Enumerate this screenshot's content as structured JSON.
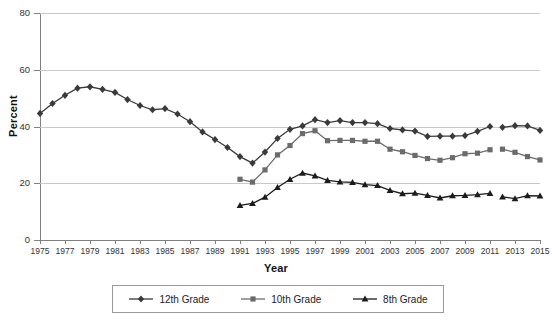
{
  "chart_data": {
    "type": "line",
    "title": "",
    "xlabel": "Year",
    "ylabel": "Percent",
    "xlim": [
      1975,
      2015
    ],
    "ylim": [
      0,
      80
    ],
    "yticks": [
      0,
      20,
      40,
      60,
      80
    ],
    "xticks": [
      1975,
      1977,
      1979,
      1981,
      1983,
      1985,
      1987,
      1989,
      1991,
      1993,
      1995,
      1997,
      1999,
      2001,
      2003,
      2005,
      2007,
      2009,
      2011,
      2013,
      2015
    ],
    "grid": "horizontal",
    "legend_position": "bottom",
    "x": [
      1975,
      1976,
      1977,
      1978,
      1979,
      1980,
      1981,
      1982,
      1983,
      1984,
      1985,
      1986,
      1987,
      1988,
      1989,
      1990,
      1991,
      1992,
      1993,
      1994,
      1995,
      1996,
      1997,
      1998,
      1999,
      2000,
      2001,
      2002,
      2003,
      2004,
      2005,
      2006,
      2007,
      2008,
      2009,
      2010,
      2011,
      2012,
      2013,
      2014,
      2015
    ],
    "series": [
      {
        "name": "12th Grade",
        "marker": "diamond",
        "color": "#3a3a3a",
        "values": [
          44.6,
          48.1,
          51.0,
          53.5,
          54.0,
          53.1,
          52.0,
          49.5,
          47.4,
          45.9,
          46.3,
          44.4,
          41.7,
          38.1,
          35.4,
          32.6,
          29.4,
          27.1,
          31.0,
          35.8,
          39.0,
          40.2,
          42.4,
          41.4,
          42.1,
          41.4,
          41.4,
          41.0,
          39.3,
          38.8,
          38.4,
          36.5,
          36.6,
          36.6,
          36.8,
          38.3,
          40.0,
          39.7,
          40.3,
          40.2,
          38.6
        ]
      },
      {
        "name": "10th Grade",
        "marker": "square",
        "color": "#6b6b6b",
        "values": [
          null,
          null,
          null,
          null,
          null,
          null,
          null,
          null,
          null,
          null,
          null,
          null,
          null,
          null,
          null,
          null,
          21.4,
          20.4,
          24.7,
          30.0,
          33.3,
          37.5,
          38.5,
          35.0,
          35.1,
          35.1,
          34.8,
          34.8,
          32.0,
          31.1,
          29.8,
          28.7,
          28.1,
          29.0,
          30.4,
          30.6,
          31.8,
          32.0,
          30.9,
          29.4,
          28.2
        ]
      },
      {
        "name": "8th Grade",
        "marker": "triangle",
        "color": "#1c1c1c",
        "values": [
          null,
          null,
          null,
          null,
          null,
          null,
          null,
          null,
          null,
          null,
          null,
          null,
          null,
          null,
          null,
          null,
          12.2,
          12.9,
          15.1,
          18.5,
          21.4,
          23.6,
          22.6,
          21.0,
          20.5,
          20.3,
          19.5,
          19.2,
          17.5,
          16.3,
          16.5,
          15.7,
          14.8,
          15.6,
          15.7,
          16.0,
          16.4,
          15.2,
          14.6,
          15.6,
          15.5
        ]
      }
    ]
  },
  "legend": {
    "items": [
      {
        "label": "12th Grade",
        "marker": "diamond"
      },
      {
        "label": "10th Grade",
        "marker": "square"
      },
      {
        "label": "8th Grade",
        "marker": "triangle"
      }
    ]
  }
}
